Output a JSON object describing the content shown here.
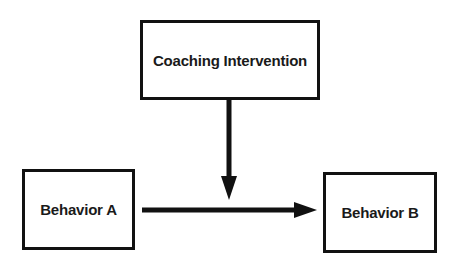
{
  "diagram": {
    "type": "flow",
    "nodes": [
      {
        "id": "coaching",
        "label": "Coaching Intervention"
      },
      {
        "id": "behavior_a",
        "label": "Behavior A"
      },
      {
        "id": "behavior_b",
        "label": "Behavior B"
      }
    ],
    "edges": [
      {
        "from": "behavior_a",
        "to": "behavior_b",
        "direction": "right"
      },
      {
        "from": "coaching",
        "to": "edge:behavior_a->behavior_b",
        "direction": "down"
      }
    ],
    "colors": {
      "stroke": "#111111",
      "background": "#ffffff",
      "text": "#1a1a1a"
    }
  }
}
